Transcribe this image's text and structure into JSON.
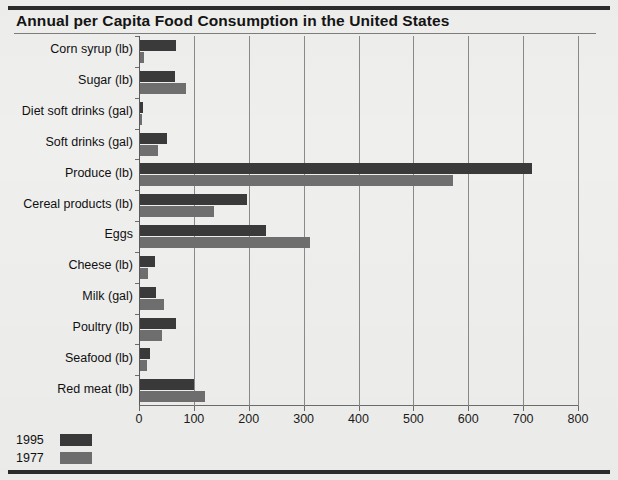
{
  "chart_data": {
    "type": "bar",
    "orientation": "horizontal",
    "title": "Annual per Capita Food Consumption in the United States",
    "xlabel": "",
    "ylabel": "",
    "xlim": [
      0,
      800
    ],
    "xticks": [
      "0",
      "100",
      "200",
      "300",
      "400",
      "500",
      "600",
      "700",
      "800"
    ],
    "grid": true,
    "legend_position": "bottom-left",
    "categories": [
      "Corn syrup (lb)",
      "Sugar (lb)",
      "Diet soft drinks (gal)",
      "Soft drinks (gal)",
      "Produce (lb)",
      "Cereal products (lb)",
      "Eggs",
      "Cheese (lb)",
      "Milk (gal)",
      "Poultry (lb)",
      "Seafood (lb)",
      "Red meat (lb)"
    ],
    "series": [
      {
        "name": "1995",
        "color": "#3a3a3a",
        "values": [
          65,
          63,
          6,
          50,
          715,
          195,
          230,
          27,
          30,
          65,
          19,
          98
        ]
      },
      {
        "name": "1977",
        "color": "#6f6f6f",
        "values": [
          7,
          83,
          3,
          32,
          570,
          135,
          310,
          14,
          43,
          40,
          12,
          119
        ]
      }
    ]
  },
  "legend": {
    "entries": [
      {
        "label": "1995",
        "color": "#3a3a3a"
      },
      {
        "label": "1977",
        "color": "#6f6f6f"
      }
    ]
  }
}
